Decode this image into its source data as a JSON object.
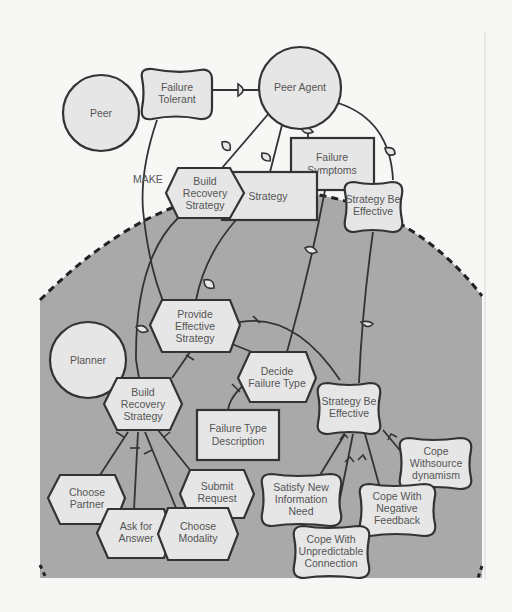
{
  "diagram": {
    "type": "i* strategic rationale model",
    "colors": {
      "background": "#f7f7f5",
      "boundary_fill": "#a9a9a9",
      "node_fill": "#e6e6e6",
      "stroke": "#333333",
      "text": "#555555"
    },
    "actors": [
      {
        "id": "peer",
        "label": "Peer"
      },
      {
        "id": "peer_agent",
        "label": "Peer Agent"
      },
      {
        "id": "planner",
        "label": "Planner"
      }
    ],
    "softgoals": [
      {
        "id": "failure_tolerant",
        "lines": [
          "Failure",
          "Tolerant"
        ]
      },
      {
        "id": "sbe_top",
        "lines": [
          "Strategy Be",
          "Effective"
        ]
      },
      {
        "id": "sbe_mid",
        "lines": [
          "Strategy Be",
          "Effective"
        ]
      },
      {
        "id": "satisfy_new",
        "lines": [
          "Satisfy New",
          "Information",
          "Need"
        ]
      },
      {
        "id": "cope_resource",
        "lines": [
          "Cope",
          "Withsource",
          "dynamism"
        ]
      },
      {
        "id": "cope_negative",
        "lines": [
          "Cope With",
          "Negative",
          "Feedback"
        ]
      },
      {
        "id": "cope_unpredictable",
        "lines": [
          "Cope With",
          "Unpredictable",
          "Connection"
        ]
      }
    ],
    "tasks": [
      {
        "id": "brs_top",
        "lines": [
          "Build",
          "Recovery",
          "Strategy"
        ]
      },
      {
        "id": "provide_effective",
        "lines": [
          "Provide",
          "Effective",
          "Strategy"
        ]
      },
      {
        "id": "brs_mid",
        "lines": [
          "Build",
          "Recovery",
          "Strategy"
        ]
      },
      {
        "id": "decide_failure",
        "lines": [
          "Decide",
          "Failure Type"
        ]
      },
      {
        "id": "choose_partner",
        "lines": [
          "Choose",
          "Partner"
        ]
      },
      {
        "id": "submit_request",
        "lines": [
          "Submit",
          "Request"
        ]
      },
      {
        "id": "ask_answer",
        "lines": [
          "Ask for",
          "Answer"
        ]
      },
      {
        "id": "choose_modality",
        "lines": [
          "Choose",
          "Modality"
        ]
      }
    ],
    "resources": [
      {
        "id": "strategy",
        "lines": [
          "Strategy"
        ]
      },
      {
        "id": "failure_symptoms",
        "lines": [
          "Failure",
          "Symptoms"
        ]
      },
      {
        "id": "failure_type_desc",
        "lines": [
          "Failure Type",
          "Description"
        ]
      }
    ],
    "link_labels": {
      "make": "MAKE"
    }
  }
}
